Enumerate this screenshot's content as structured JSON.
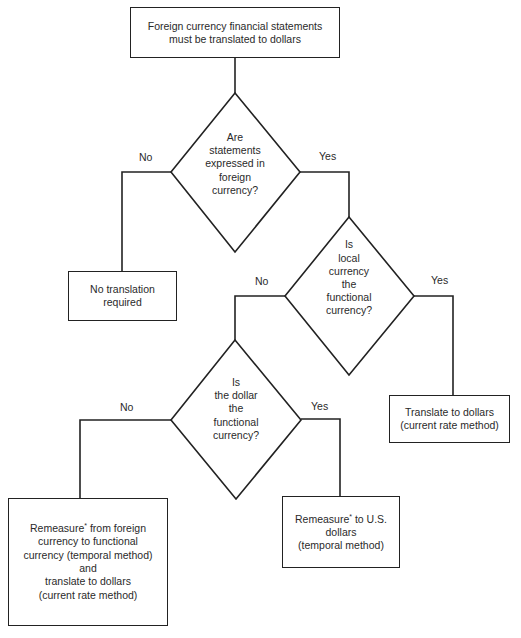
{
  "diagram": {
    "type": "flowchart",
    "start": {
      "id": "start",
      "lines": [
        "Foreign currency financial statements",
        "must be translated to dollars"
      ]
    },
    "decisions": [
      {
        "id": "d1",
        "lines": [
          "Are",
          "statements",
          "expressed in",
          "foreign",
          "currency?"
        ],
        "no_label": "No",
        "yes_label": "Yes"
      },
      {
        "id": "d2",
        "lines": [
          "Is",
          "local",
          "currency",
          "the",
          "functional",
          "currency?"
        ],
        "no_label": "No",
        "yes_label": "Yes"
      },
      {
        "id": "d3",
        "lines": [
          "Is",
          "the dollar",
          "the",
          "functional",
          "currency?"
        ],
        "no_label": "No",
        "yes_label": "Yes"
      }
    ],
    "outcomes": [
      {
        "id": "o1",
        "lines": [
          "No translation",
          "required"
        ]
      },
      {
        "id": "o2",
        "lines": [
          "Translate to dollars",
          "(current rate method)"
        ]
      },
      {
        "id": "o3",
        "word": "Remeasure",
        "mark": "*",
        "lines": [
          " from foreign",
          "currency to functional",
          "currency (temporal method)",
          "and",
          "translate to dollars",
          "(current rate method)"
        ]
      },
      {
        "id": "o4",
        "word": "Remeasure",
        "mark": "*",
        "lines": [
          " to U.S.",
          "dollars",
          "(temporal method)"
        ]
      }
    ],
    "edges": [
      {
        "from": "start",
        "to": "d1",
        "label": ""
      },
      {
        "from": "d1",
        "to": "o1",
        "label": "No"
      },
      {
        "from": "d1",
        "to": "d2",
        "label": "Yes"
      },
      {
        "from": "d2",
        "to": "d3",
        "label": "No"
      },
      {
        "from": "d2",
        "to": "o2",
        "label": "Yes"
      },
      {
        "from": "d3",
        "to": "o3",
        "label": "No"
      },
      {
        "from": "d3",
        "to": "o4",
        "label": "Yes"
      }
    ],
    "colors": {
      "stroke": "#222222",
      "text": "#2a2a2a",
      "background": "#ffffff"
    }
  }
}
